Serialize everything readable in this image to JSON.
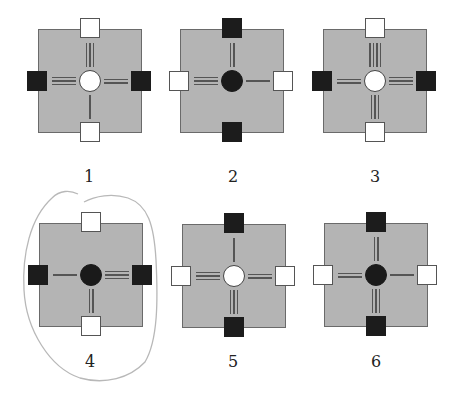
{
  "figure": {
    "annotation": {
      "type": "hand-drawn-circle",
      "around_figure": "4",
      "color": "#b8b8b8"
    },
    "colors": {
      "board": "#b4b4b4",
      "black": "#1c1c1c",
      "white": "#ffffff",
      "lines": "#555555"
    },
    "panels": [
      {
        "label": "1",
        "x": 38,
        "y": 29,
        "center": "white",
        "blocks": {
          "top": "white",
          "bottom": "white",
          "left": "black",
          "right": "black"
        },
        "lines": {
          "top": 3,
          "bottom": 1,
          "left": 3,
          "right": 2
        }
      },
      {
        "label": "2",
        "x": 180,
        "y": 29,
        "center": "black",
        "blocks": {
          "top": "black",
          "bottom": "black",
          "left": "white",
          "right": "white"
        },
        "lines": {
          "top": 2,
          "bottom": 0,
          "left": 3,
          "right": 1
        }
      },
      {
        "label": "3",
        "x": 323,
        "y": 29,
        "center": "white",
        "blocks": {
          "top": "white",
          "bottom": "white",
          "left": "black",
          "right": "black"
        },
        "lines": {
          "top": 4,
          "bottom": 3,
          "left": 2,
          "right": 3
        }
      },
      {
        "label": "4",
        "x": 39,
        "y": 223,
        "center": "black",
        "blocks": {
          "top": "white",
          "bottom": "white",
          "left": "black",
          "right": "black"
        },
        "lines": {
          "top": 0,
          "bottom": 2,
          "left": 1,
          "right": 3
        }
      },
      {
        "label": "5",
        "x": 182,
        "y": 224,
        "center": "white",
        "blocks": {
          "top": "black",
          "bottom": "black",
          "left": "white",
          "right": "white"
        },
        "lines": {
          "top": 1,
          "bottom": 3,
          "left": 3,
          "right": 2
        }
      },
      {
        "label": "6",
        "x": 324,
        "y": 223,
        "center": "black",
        "blocks": {
          "top": "black",
          "bottom": "black",
          "left": "white",
          "right": "white"
        },
        "lines": {
          "top": 2,
          "bottom": 3,
          "left": 2,
          "right": 1
        }
      }
    ],
    "label_positions": [
      {
        "x": 89,
        "y": 167
      },
      {
        "x": 233,
        "y": 167
      },
      {
        "x": 375,
        "y": 167
      },
      {
        "x": 90,
        "y": 352
      },
      {
        "x": 233,
        "y": 352
      },
      {
        "x": 376,
        "y": 352
      }
    ]
  }
}
